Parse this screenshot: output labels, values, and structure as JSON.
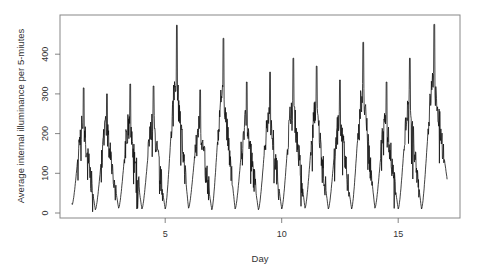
{
  "chart_data": {
    "type": "line",
    "title": "",
    "xlabel": "Day",
    "ylabel": "Average internal illuminance per 5-miutes",
    "xlim": [
      0.5,
      17.7
    ],
    "ylim": [
      -10,
      480
    ],
    "x_ticks": [
      5,
      10,
      15
    ],
    "y_ticks": [
      0,
      100,
      200,
      300,
      400
    ],
    "grid": false,
    "legend": null,
    "line_color": "#111111",
    "series": [
      {
        "name": "illuminance",
        "daily_profile": [
          {
            "day": 1,
            "min": 20,
            "peak": 315
          },
          {
            "day": 2,
            "min": 8,
            "peak": 300
          },
          {
            "day": 3,
            "min": 12,
            "peak": 325
          },
          {
            "day": 4,
            "min": 10,
            "peak": 320
          },
          {
            "day": 5,
            "min": 10,
            "peak": 473
          },
          {
            "day": 6,
            "min": 12,
            "peak": 310
          },
          {
            "day": 7,
            "min": 8,
            "peak": 440
          },
          {
            "day": 8,
            "min": 10,
            "peak": 330
          },
          {
            "day": 9,
            "min": 8,
            "peak": 355
          },
          {
            "day": 10,
            "min": 10,
            "peak": 390
          },
          {
            "day": 11,
            "min": 12,
            "peak": 370
          },
          {
            "day": 12,
            "min": 10,
            "peak": 335
          },
          {
            "day": 13,
            "min": 10,
            "peak": 430
          },
          {
            "day": 14,
            "min": 12,
            "peak": 330
          },
          {
            "day": 15,
            "min": 10,
            "peak": 390
          },
          {
            "day": 16,
            "min": 10,
            "peak": 475
          }
        ],
        "start": {
          "x": 1.0,
          "y": 25
        },
        "end": {
          "x": 17.1,
          "y": 85
        }
      }
    ]
  },
  "labels": {
    "x_axis": "Day",
    "y_axis": "Average internal illuminance per 5-miutes",
    "x_ticks": [
      "5",
      "10",
      "15"
    ],
    "y_ticks": [
      "0",
      "100",
      "200",
      "300",
      "400"
    ]
  }
}
